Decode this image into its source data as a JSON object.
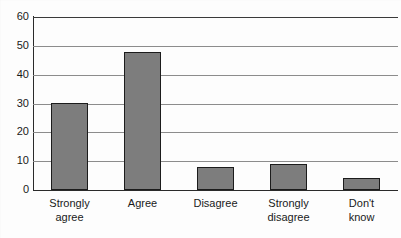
{
  "chart_data": {
    "type": "bar",
    "title": "",
    "subtitle": "",
    "xlabel": "",
    "ylabel": "",
    "categories": [
      "Strongly agree",
      "Agree",
      "Disagree",
      "Strongly disagree",
      "Don't know"
    ],
    "category_lines": [
      [
        "Strongly",
        "agree"
      ],
      [
        "Agree"
      ],
      [
        "Disagree"
      ],
      [
        "Strongly",
        "disagree"
      ],
      [
        "Don't",
        "know"
      ]
    ],
    "values": [
      30,
      48,
      8,
      9,
      4
    ],
    "ylim": [
      0,
      60
    ],
    "ytick_labels": [
      "0",
      "10",
      "20",
      "30",
      "40",
      "50",
      "60"
    ],
    "ytick_values": [
      0,
      10,
      20,
      30,
      40,
      50,
      60
    ],
    "grid": true,
    "legend": "none",
    "bar_color": "#7d7d7d",
    "bar_edge_color": "#1c1c1c",
    "grid_color": "#8c8c8c",
    "axis_color": "#2a2a2a",
    "background_color": "#fdfdfd"
  }
}
